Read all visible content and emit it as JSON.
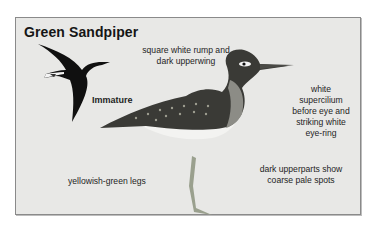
{
  "figure": {
    "title": "Green Sandpiper",
    "annotations": {
      "rump": "square white rump and dark upperwing",
      "rump_line1": "square white rump and",
      "rump_line2": "dark upperwing",
      "immature": "Immature",
      "supercilium_line1": "white",
      "supercilium_line2": "supercilium",
      "supercilium_line3": "before eye and",
      "supercilium_line4": "striking white",
      "supercilium_line5": "eye-ring",
      "legs": "yellowish-green legs",
      "upperparts_line1": "dark upperparts show",
      "upperparts_line2": "coarse pale spots"
    },
    "illustrations": [
      "flying-immature-bird",
      "standing-adult-bird"
    ],
    "colors": {
      "panel_background": "#e8e8e6",
      "panel_border": "#8a8a8a",
      "text": "#1e1e1e"
    }
  }
}
